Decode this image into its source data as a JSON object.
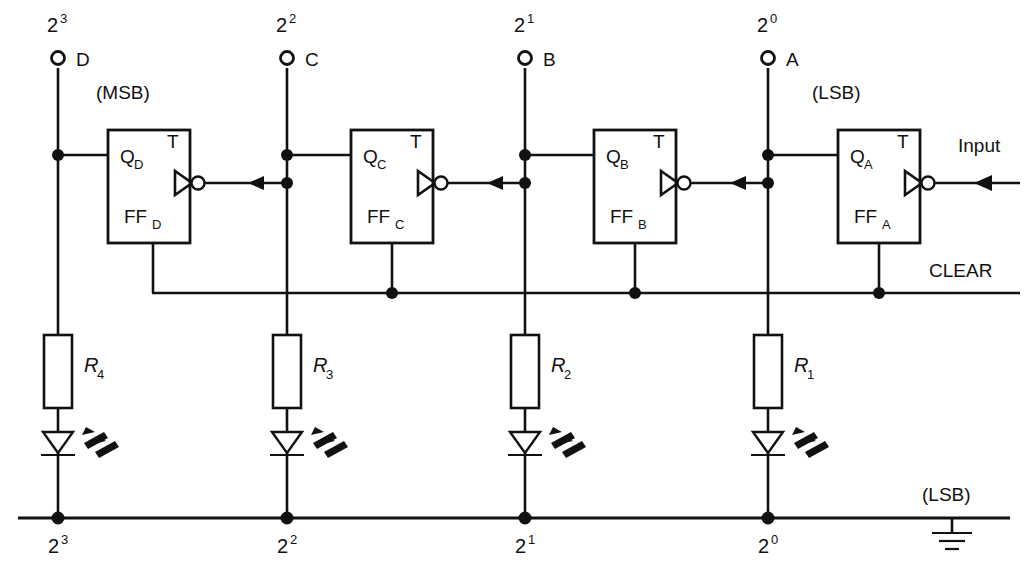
{
  "figure": {
    "kind": "schematic-diagram",
    "background_color": "#ffffff",
    "ink_color": "#111111"
  },
  "top_terminals": [
    {
      "power_base": "2",
      "power_exp": "3",
      "name": "D"
    },
    {
      "power_base": "2",
      "power_exp": "2",
      "name": "C"
    },
    {
      "power_base": "2",
      "power_exp": "1",
      "name": "B"
    },
    {
      "power_base": "2",
      "power_exp": "0",
      "name": "A"
    }
  ],
  "annotations": {
    "msb": "(MSB)",
    "lsb_top": "(LSB)",
    "lsb_ground": "(LSB)",
    "clear": "CLEAR",
    "input": "Input"
  },
  "flipflops": [
    {
      "q_label": "Q",
      "q_sub": "D",
      "t_label": "T",
      "ff_label": "FF",
      "ff_sub": "D"
    },
    {
      "q_label": "Q",
      "q_sub": "C",
      "t_label": "T",
      "ff_label": "FF",
      "ff_sub": "C"
    },
    {
      "q_label": "Q",
      "q_sub": "B",
      "t_label": "T",
      "ff_label": "FF",
      "ff_sub": "B"
    },
    {
      "q_label": "Q",
      "q_sub": "A",
      "t_label": "T",
      "ff_label": "FF",
      "ff_sub": "A"
    }
  ],
  "resistors": [
    {
      "name": "R",
      "sub": "4"
    },
    {
      "name": "R",
      "sub": "3"
    },
    {
      "name": "R",
      "sub": "2"
    },
    {
      "name": "R",
      "sub": "1"
    }
  ],
  "bottom_bus_labels": [
    {
      "base": "2",
      "exp": "3"
    },
    {
      "base": "2",
      "exp": "2"
    },
    {
      "base": "2",
      "exp": "1"
    },
    {
      "base": "2",
      "exp": "0"
    }
  ],
  "leds": [
    {
      "name": "led-bit-3",
      "emits_light": true
    },
    {
      "name": "led-bit-2",
      "emits_light": true
    },
    {
      "name": "led-bit-1",
      "emits_light": true
    },
    {
      "name": "led-bit-0",
      "emits_light": true
    }
  ],
  "ground": {
    "symbol": "earth-ground",
    "bars": 3
  }
}
